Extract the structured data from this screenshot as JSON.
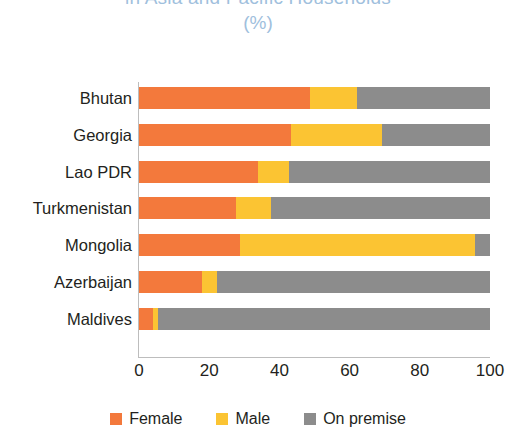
{
  "chart_data": {
    "type": "bar",
    "orientation": "horizontal",
    "stacked": true,
    "title": "in Asia and Pacific Households",
    "subtitle": "(%)",
    "xlabel": "",
    "ylabel": "",
    "xlim": [
      0,
      100
    ],
    "xticks": [
      "0",
      "20",
      "40",
      "60",
      "80",
      "100"
    ],
    "grid": false,
    "legend_position": "bottom",
    "categories": [
      "Bhutan",
      "Georgia",
      "Lao PDR",
      "Turkmenistan",
      "Mongolia",
      "Azerbaijan",
      "Maldives"
    ],
    "series": [
      {
        "name": "Female",
        "color": "#F3793C",
        "values": [
          48.7,
          43.3,
          34.0,
          27.6,
          28.8,
          18.0,
          4.0
        ]
      },
      {
        "name": "Male",
        "color": "#FBC433",
        "values": [
          13.4,
          26.0,
          8.8,
          10.0,
          67.0,
          4.3,
          1.5
        ]
      },
      {
        "name": "On premise",
        "color": "#8C8C8C",
        "values": [
          37.9,
          30.7,
          57.2,
          62.4,
          4.2,
          77.7,
          94.5
        ]
      }
    ]
  },
  "colors": {
    "female": "#F3793C",
    "male": "#FBC433",
    "on_premise": "#8C8C8C",
    "title": "#9FC0DD",
    "axis": "#BDBDBD",
    "text": "#231F20",
    "background": "#FFFFFF"
  }
}
